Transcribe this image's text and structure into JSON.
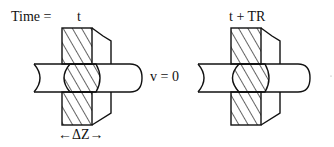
{
  "labels": {
    "time_prefix": "Time =",
    "time_left": "t",
    "time_right": "t + TR",
    "velocity": "v = 0",
    "delta_z": "←ΔZ→"
  },
  "panels": [
    {
      "name": "left",
      "time": "t"
    },
    {
      "name": "right",
      "time": "t + TR"
    }
  ],
  "colors": {
    "stroke": "#111111",
    "background": "#ffffff"
  }
}
